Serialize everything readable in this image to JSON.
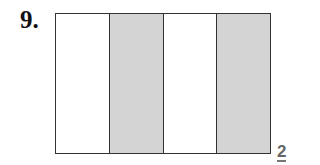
{
  "problem": {
    "number": "9.",
    "answer": "2"
  },
  "figure": {
    "shape": "rectangle",
    "parts": [
      {
        "shaded": false,
        "color": "#ffffff"
      },
      {
        "shaded": true,
        "color": "#d4d4d4"
      },
      {
        "shaded": false,
        "color": "#ffffff"
      },
      {
        "shaded": true,
        "color": "#d4d4d4"
      }
    ],
    "total_parts": 4,
    "shaded_parts": 2
  }
}
